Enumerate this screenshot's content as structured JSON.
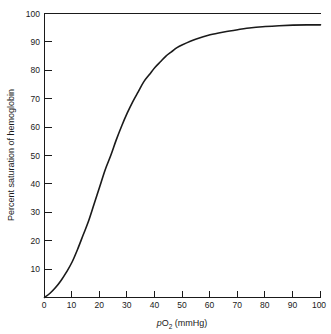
{
  "chart_data": {
    "type": "line",
    "title": "",
    "xlabel": "pO2 (mmHg)",
    "xlabel_parts": {
      "italic_prefix": "p",
      "base": "O",
      "subscript": "2",
      "suffix": " (mmHg)"
    },
    "ylabel": "Percent saturation of hemoglobin",
    "xlim": [
      0,
      100
    ],
    "ylim": [
      0,
      100
    ],
    "grid": false,
    "legend": "none",
    "line_color": "#1a1a1a",
    "background_color": "#ffffff",
    "xticks": [
      0,
      10,
      20,
      30,
      40,
      50,
      60,
      70,
      80,
      90,
      100
    ],
    "xtick_labels": [
      "0",
      "10",
      "20",
      "30",
      "40",
      "50",
      "60",
      "70",
      "80",
      "90",
      "100"
    ],
    "yticks": [
      0,
      10,
      20,
      30,
      40,
      50,
      60,
      70,
      80,
      90,
      100
    ],
    "ytick_labels": [
      "0",
      "10",
      "20",
      "30",
      "40",
      "50",
      "60",
      "70",
      "80",
      "90",
      "100"
    ],
    "series": [
      {
        "name": "Oxygen-hemoglobin dissociation curve",
        "x": [
          0,
          2,
          4,
          6,
          8,
          10,
          12,
          14,
          16,
          18,
          20,
          22,
          24,
          26,
          28,
          30,
          32,
          34,
          36,
          38,
          40,
          42,
          44,
          46,
          48,
          50,
          55,
          60,
          65,
          70,
          75,
          80,
          85,
          90,
          95,
          100
        ],
        "y": [
          0,
          1.5,
          3.5,
          6,
          9,
          12.5,
          17,
          22,
          27,
          33,
          39,
          45,
          50,
          55.5,
          60.5,
          65,
          69,
          72.5,
          76,
          78.5,
          81,
          83,
          85,
          86.5,
          88,
          89,
          91,
          92.5,
          93.5,
          94.3,
          95,
          95.4,
          95.7,
          95.9,
          96,
          96
        ]
      }
    ],
    "annotations": {
      "p50_x": 24,
      "p50_y": 50,
      "plateau_y": 96
    }
  },
  "axes": {
    "x_axis_name": "x-axis",
    "y_axis_name": "y-axis"
  }
}
